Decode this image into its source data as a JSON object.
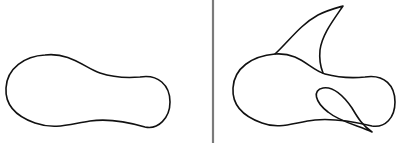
{
  "figure": {
    "panels": [
      {
        "id": "left",
        "label": "",
        "shape": "peanut-blob"
      },
      {
        "id": "right",
        "label": "",
        "shape": "peanut-blob-with-fin-and-loop"
      }
    ],
    "colors": {
      "stroke": "#111111",
      "divider": "#7a7a7a",
      "background": "#ffffff"
    }
  }
}
